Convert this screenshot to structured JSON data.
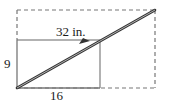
{
  "figure": {
    "name": "right-triangle-ramp-diagram",
    "background_color": "#ffffff",
    "stroke_color": "#555555",
    "dash_color": "#777777",
    "diagonal_color": "#333333",
    "labels": {
      "hypotenuse": "32 in.",
      "height": "9",
      "base": "16"
    },
    "geometry": {
      "outer_rect": {
        "x": 17,
        "y": 10,
        "width": 138,
        "height": 78,
        "style": "dashed"
      },
      "inner_rect": {
        "x": 17,
        "y": 40,
        "width": 83,
        "height": 48,
        "style": "solid"
      },
      "diagonal": {
        "x1": 17,
        "y1": 88,
        "x2": 155,
        "y2": 10,
        "style": "solid-thick"
      },
      "leader_line": {
        "x1": 17,
        "y1": 40,
        "x2": 90,
        "y2": 40,
        "arrow": "arrowhead-right"
      }
    },
    "measurements": {
      "hypotenuse_value": 32,
      "hypotenuse_unit": "in.",
      "height_value": 9,
      "base_value": 16
    }
  }
}
